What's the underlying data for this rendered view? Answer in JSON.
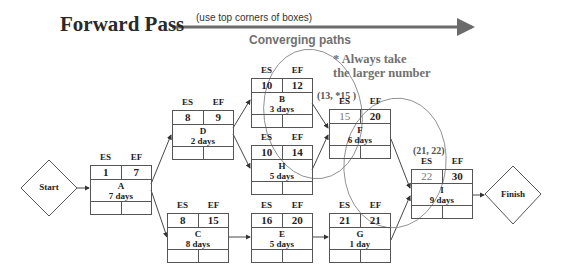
{
  "header": {
    "title": "Forward Pass",
    "arrow_note": "(use top corners of boxes)",
    "converging_label": "Converging paths",
    "rule_line1": "* Always  take",
    "rule_line2": "the larger number"
  },
  "column_labels": {
    "es": "ES",
    "ef": "EF"
  },
  "terminals": {
    "start": {
      "label": "Start"
    },
    "finish": {
      "label": "Finish"
    }
  },
  "nodes": {
    "A": {
      "name": "A",
      "duration": "7 days",
      "es": "1",
      "ef": "7"
    },
    "D": {
      "name": "D",
      "duration": "2 days",
      "es": "8",
      "ef": "9"
    },
    "B": {
      "name": "B",
      "duration": "3 days",
      "es": "10",
      "ef": "12"
    },
    "H": {
      "name": "H",
      "duration": "5 days",
      "es": "10",
      "ef": "14"
    },
    "F": {
      "name": "F",
      "duration": "6 days",
      "es": "15",
      "ef": "20"
    },
    "C": {
      "name": "C",
      "duration": "8 days",
      "es": "8",
      "ef": "15"
    },
    "E": {
      "name": "E",
      "duration": "5 days",
      "es": "16",
      "ef": "20"
    },
    "G": {
      "name": "G",
      "duration": "1 day",
      "es": "21",
      "ef": "21"
    },
    "I": {
      "name": "I",
      "duration": "9 days",
      "es": "22",
      "ef": "30"
    }
  },
  "annotations": {
    "converge_f": "(13, *15 )",
    "converge_i": "(21, 22)"
  },
  "colors": {
    "arrow": "#6b6b6b",
    "text_dark": "#222222",
    "text_gray": "#707070",
    "line": "#555555"
  }
}
